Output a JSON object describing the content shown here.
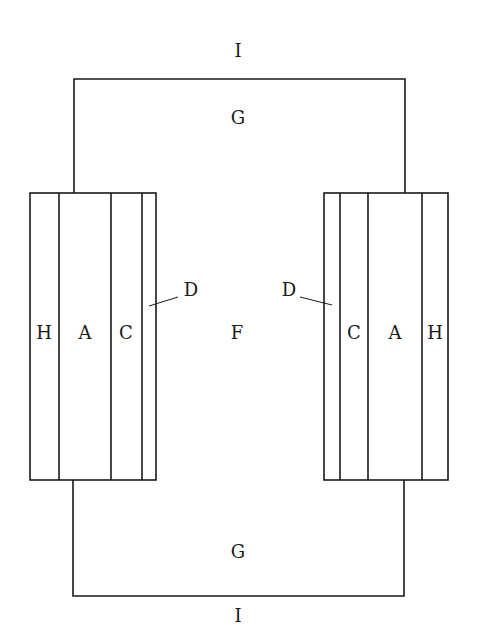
{
  "diagram": {
    "top_wire_label": "I",
    "bottom_wire_label": "I",
    "top_region_label": "G",
    "bottom_region_label": "G",
    "center_label": "F",
    "left_stack": {
      "layers": [
        "H",
        "A",
        "C",
        "D"
      ],
      "labels": {
        "H": "H",
        "A": "A",
        "C": "C"
      },
      "pointer_label": "D"
    },
    "right_stack": {
      "layers": [
        "D",
        "C",
        "A",
        "H"
      ],
      "labels": {
        "C": "C",
        "A": "A",
        "H": "H"
      },
      "pointer_label": "D"
    }
  }
}
